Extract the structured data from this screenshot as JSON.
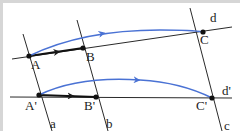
{
  "diagram": {
    "colors": {
      "line": "#1a1a1a",
      "curve": "#4a72d4",
      "point": "#111111",
      "border": "#d6d6d6"
    },
    "labels": {
      "A": "A",
      "B": "B",
      "C": "C",
      "d": "d",
      "A_prime": "A'",
      "B_prime": "B'",
      "C_prime": "C'",
      "d_prime": "d'",
      "a": "a",
      "b": "b",
      "c": "c"
    },
    "points": [
      "A",
      "B",
      "C",
      "A'",
      "B'",
      "C'"
    ],
    "lines": [
      "d",
      "d'",
      "a",
      "b",
      "c"
    ],
    "vectors": [
      {
        "from": "A",
        "to": "B",
        "style": "black-arrow"
      },
      {
        "from": "A",
        "to": "C",
        "style": "blue-curved-arrow"
      },
      {
        "from": "A'",
        "to": "B'",
        "style": "black-arrow"
      },
      {
        "from": "A'",
        "to": "C'",
        "style": "blue-curved-arrow"
      }
    ]
  }
}
